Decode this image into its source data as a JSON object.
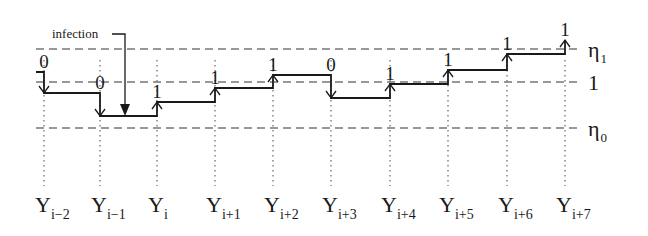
{
  "diagram": {
    "type": "step-signal-timeline",
    "annotation": "infection",
    "thresholds": [
      {
        "id": "eta1",
        "label": "η",
        "subscript": "1",
        "y": 49
      },
      {
        "id": "one",
        "label": "1",
        "subscript": "",
        "y": 82
      },
      {
        "id": "eta0",
        "label": "η",
        "subscript": "0",
        "y": 128
      }
    ],
    "columns": [
      {
        "label": "Y",
        "subscript": "i−2",
        "x": 44,
        "bit": "0",
        "direction": "down",
        "level_after": 93
      },
      {
        "label": "Y",
        "subscript": "i−1",
        "x": 100,
        "bit": "0",
        "direction": "down",
        "level_after": 116
      },
      {
        "label": "Y",
        "subscript": "i",
        "x": 157,
        "bit": "1",
        "direction": "up",
        "level_after": 102
      },
      {
        "label": "Y",
        "subscript": "i+1",
        "x": 215,
        "bit": "1",
        "direction": "up",
        "level_after": 88
      },
      {
        "label": "Y",
        "subscript": "i+2",
        "x": 273,
        "bit": "1",
        "direction": "up",
        "level_after": 75
      },
      {
        "label": "Y",
        "subscript": "i+3",
        "x": 331,
        "bit": "0",
        "direction": "down",
        "level_after": 98
      },
      {
        "label": "Y",
        "subscript": "i+4",
        "x": 390,
        "bit": "1",
        "direction": "up",
        "level_after": 84
      },
      {
        "label": "Y",
        "subscript": "i+5",
        "x": 448,
        "bit": "1",
        "direction": "up",
        "level_after": 70
      },
      {
        "label": "Y",
        "subscript": "i+6",
        "x": 507,
        "bit": "1",
        "direction": "up",
        "level_after": 54
      },
      {
        "label": "Y",
        "subscript": "i+7",
        "x": 565,
        "bit": "1",
        "direction": "up",
        "level_after": 40
      }
    ]
  }
}
